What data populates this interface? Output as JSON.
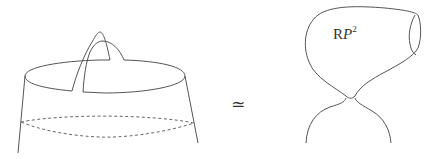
{
  "figure": {
    "left": {
      "description": "Cylinder with a cross-cap handle attached at the top rim, and a dashed ellipse cross-section below"
    },
    "relation_symbol": "≃",
    "right": {
      "description": "Pinched surface: a real projective plane bulb joined to a lower sheet at a pinch point",
      "label": {
        "base": "R",
        "italic": "P",
        "superscript": "2"
      }
    }
  },
  "colors": {
    "line": "#555555",
    "text": "#333333",
    "background": "#ffffff"
  }
}
